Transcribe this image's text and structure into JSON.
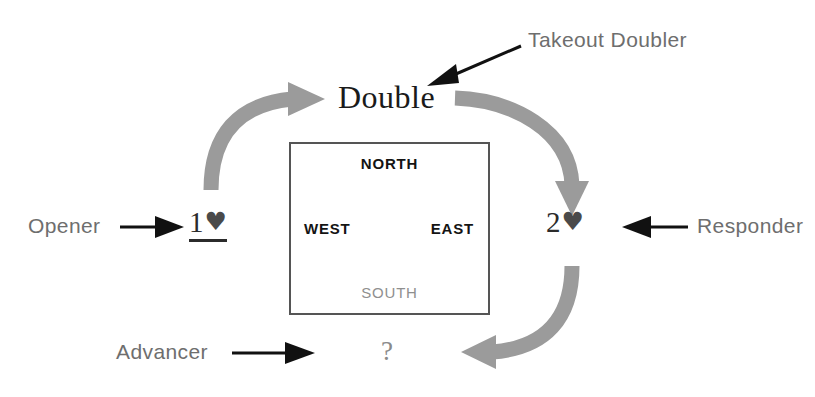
{
  "diagram": {
    "colors": {
      "flow_arrow": "#9b9b9b",
      "pointer_arrow": "#111111",
      "role_text": "#6e6e6e",
      "call_text": "#1a1a1a",
      "box_border": "#555555",
      "muted_text": "#8f8f8f"
    }
  },
  "roles": {
    "opener": "Opener",
    "responder": "Responder",
    "advancer": "Advancer",
    "takeout_doubler": "Takeout Doubler"
  },
  "calls": {
    "opener_bid": {
      "level": "1",
      "suit": "♥",
      "underlined": true
    },
    "doubler_call": "Double",
    "responder_bid": {
      "level": "2",
      "suit": "♥",
      "underlined": false
    },
    "advancer_call": "?"
  },
  "compass": {
    "north": "NORTH",
    "south": "SOUTH",
    "west": "WEST",
    "east": "EAST"
  },
  "flow": {
    "step_1_label": "opener-to-doubler",
    "step_2_label": "doubler-to-responder",
    "step_3_label": "responder-to-advancer"
  }
}
